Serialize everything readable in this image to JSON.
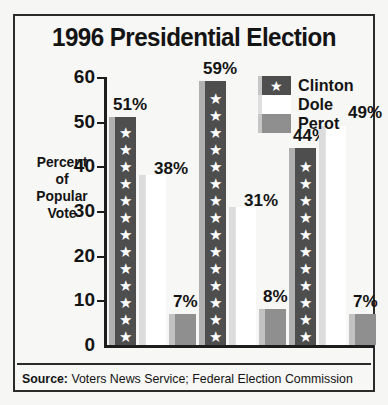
{
  "chart_data": {
    "type": "bar",
    "title": "1996 Presidential Election",
    "xlabel": "",
    "ylabel": "Percent of Popular Vote",
    "categories": [
      "California",
      "New York",
      "Texas"
    ],
    "series": [
      {
        "name": "Clinton",
        "values": [
          51,
          59,
          44
        ],
        "labels": [
          "51%",
          "59%",
          "44%"
        ],
        "color": "#4e4e4e",
        "pattern": "stars"
      },
      {
        "name": "Dole",
        "values": [
          38,
          31,
          49
        ],
        "labels": [
          "38%",
          "31%",
          "49%"
        ],
        "color": "#ffffff",
        "pattern": "solid"
      },
      {
        "name": "Perot",
        "values": [
          7,
          8,
          7
        ],
        "labels": [
          "7%",
          "8%",
          "7%"
        ],
        "color": "#8f8f8f",
        "pattern": "solid"
      }
    ],
    "ylim": [
      0,
      60
    ],
    "yticks": [
      0,
      10,
      20,
      30,
      40,
      50,
      60
    ],
    "ytick_labels": [
      "0",
      "10",
      "20",
      "30",
      "40",
      "50",
      "60"
    ],
    "grid": false,
    "legend_position": "top-right"
  },
  "axis": {
    "caption_lines": [
      "Percent",
      "of",
      "Popular",
      "Vote"
    ]
  },
  "legend": {
    "items": [
      {
        "label": "Clinton",
        "icon": "star-glyph"
      },
      {
        "label": "Dole",
        "icon": ""
      },
      {
        "label": "Perot",
        "icon": ""
      }
    ]
  },
  "source": {
    "prefix": "Source:",
    "text": "Voters News Service; Federal Election Commission"
  }
}
